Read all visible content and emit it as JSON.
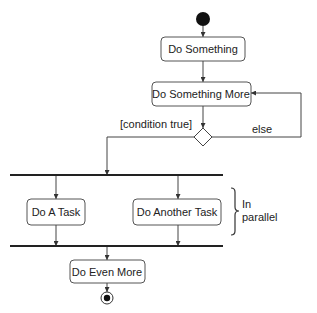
{
  "diagram": {
    "type": "UML activity diagram",
    "nodes": {
      "do_something": "Do Something",
      "do_something_more": "Do Something More",
      "do_a_task": "Do A Task",
      "do_another_task": "Do Another Task",
      "do_even_more": "Do Even More"
    },
    "guards": {
      "condition_true": "[condition true]",
      "else": "else"
    },
    "annotation": {
      "line1": "In",
      "line2": "parallel"
    },
    "colors": {
      "stroke": "#444444",
      "bar": "#222222",
      "text": "#222222",
      "background": "#ffffff"
    }
  }
}
